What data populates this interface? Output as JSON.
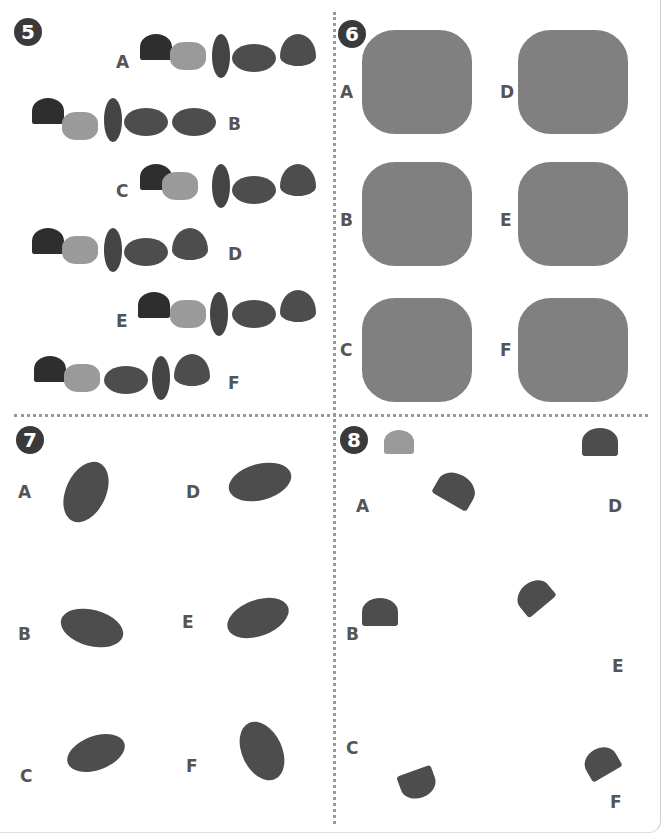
{
  "puzzles": [
    {
      "number": "5",
      "options": [
        "A",
        "B",
        "C",
        "D",
        "E",
        "F"
      ],
      "description": "Rows of leaves (ginkgo, small maple, pale maple, narrow leaf, round leaf, pointed leaf) in differing orders"
    },
    {
      "number": "6",
      "options": [
        "A",
        "B",
        "C",
        "D",
        "E",
        "F"
      ],
      "description": "Square clusters of assorted leaves"
    },
    {
      "number": "7",
      "options": [
        "A",
        "B",
        "C",
        "D",
        "E",
        "F"
      ],
      "description": "Central large leaf surrounded by smaller leaves"
    },
    {
      "number": "8",
      "options": [
        "A",
        "B",
        "C",
        "D",
        "E",
        "F"
      ],
      "description": "Ginkgo leaves with paired small leaves"
    }
  ]
}
